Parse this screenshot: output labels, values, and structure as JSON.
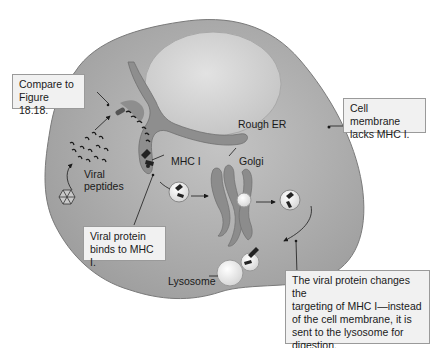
{
  "figure": {
    "labels": {
      "rough_er": "Rough ER",
      "mhc1": "MHC I",
      "golgi": "Golgi",
      "viral_peptides": "Viral\npeptides",
      "lysosome": "Lysosome"
    },
    "callouts": {
      "compare": "Compare to\nFigure 18.18.",
      "cell_membrane": "Cell membrane\nlacks MHC I.",
      "viral_protein": "Viral protein\nbinds to MHC I.",
      "targeting": "The viral protein changes the\ntargeting of MHC I—instead\nof the cell membrane, it is\nsent to the lysosome for\ndigestion."
    },
    "colors": {
      "cytoplasm": "#a9a9a9",
      "nucleus": "#d2d2d2",
      "er": "#8e8e8e",
      "callout_bg": "#f1f1f1",
      "ink": "#1a1a1a"
    }
  }
}
